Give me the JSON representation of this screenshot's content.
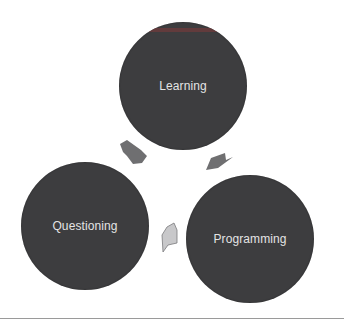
{
  "diagram": {
    "type": "cycle",
    "nodes": [
      {
        "id": "learning",
        "label": "Learning"
      },
      {
        "id": "programming",
        "label": "Programming"
      },
      {
        "id": "questioning",
        "label": "Questioning"
      }
    ],
    "edges": [
      {
        "from": "learning",
        "to": "programming"
      },
      {
        "from": "programming",
        "to": "questioning"
      },
      {
        "from": "questioning",
        "to": "learning"
      }
    ],
    "colors": {
      "node_fill": "#3d3d3f",
      "node_text": "#e4e4e4",
      "arrow_dark": "#6f6f71",
      "arrow_light": "#c8c8ca",
      "divider": "#9a9a9a",
      "background": "#ffffff"
    }
  }
}
